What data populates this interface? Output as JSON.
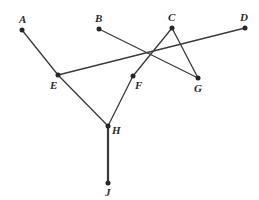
{
  "figure": {
    "background_color": "#ffffff",
    "stroke_color": "#3a3a3a",
    "point_color": "#262626",
    "label_color": "#2b2b2b",
    "width": 259,
    "height": 200
  },
  "points": [
    {
      "id": "A",
      "label": "A",
      "x": 22,
      "y": 30,
      "label_x": 19,
      "label_y": 14
    },
    {
      "id": "B",
      "label": "B",
      "x": 99,
      "y": 29,
      "label_x": 95,
      "label_y": 13
    },
    {
      "id": "C",
      "label": "C",
      "x": 172,
      "y": 28,
      "label_x": 168,
      "label_y": 12
    },
    {
      "id": "D",
      "label": "D",
      "x": 245,
      "y": 28,
      "label_x": 240,
      "label_y": 12
    },
    {
      "id": "E",
      "label": "E",
      "x": 58,
      "y": 75,
      "label_x": 50,
      "label_y": 80
    },
    {
      "id": "F",
      "label": "F",
      "x": 133,
      "y": 76,
      "label_x": 135,
      "label_y": 80
    },
    {
      "id": "G",
      "label": "G",
      "x": 198,
      "y": 78,
      "label_x": 194,
      "label_y": 83
    },
    {
      "id": "H",
      "label": "H",
      "x": 108,
      "y": 126,
      "label_x": 112,
      "label_y": 125
    },
    {
      "id": "J",
      "label": "J",
      "x": 108,
      "y": 183,
      "label_x": 105,
      "label_y": 187
    }
  ],
  "segments": [
    {
      "id": "A-E",
      "from": "A",
      "to": "E",
      "x1": 22,
      "y1": 30,
      "x2": 58,
      "y2": 75,
      "width": 1.3
    },
    {
      "id": "E-D",
      "from": "E",
      "to": "D",
      "x1": 58,
      "y1": 75,
      "x2": 245,
      "y2": 28,
      "width": 1.3
    },
    {
      "id": "B-G",
      "from": "B",
      "to": "G",
      "x1": 99,
      "y1": 29,
      "x2": 198,
      "y2": 78,
      "width": 1.3
    },
    {
      "id": "C-F",
      "from": "C",
      "to": "F",
      "x1": 172,
      "y1": 28,
      "x2": 133,
      "y2": 76,
      "width": 1.3
    },
    {
      "id": "C-G",
      "from": "C",
      "to": "G",
      "x1": 172,
      "y1": 28,
      "x2": 198,
      "y2": 78,
      "width": 1.3
    },
    {
      "id": "E-H",
      "from": "E",
      "to": "H",
      "x1": 58,
      "y1": 75,
      "x2": 108,
      "y2": 126,
      "width": 1.3
    },
    {
      "id": "F-H",
      "from": "F",
      "to": "H",
      "x1": 133,
      "y1": 76,
      "x2": 108,
      "y2": 126,
      "width": 1.3
    },
    {
      "id": "H-J",
      "from": "H",
      "to": "J",
      "x1": 108,
      "y1": 126,
      "x2": 108,
      "y2": 183,
      "width": 2.2
    }
  ]
}
